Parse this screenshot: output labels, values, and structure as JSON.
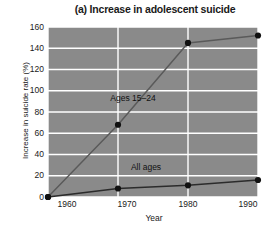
{
  "chart_data": {
    "type": "line",
    "title": "(a) Increase in adolescent suicide",
    "xlabel": "Year",
    "ylabel": "Increase in suicide rate (%)",
    "x": [
      1960,
      1970,
      1980,
      1990
    ],
    "xticklabels": [
      "1960",
      "1970",
      "1980",
      "1990"
    ],
    "yticklabels": [
      "0",
      "20",
      "40",
      "60",
      "80",
      "100",
      "120",
      "140",
      "160"
    ],
    "yticks": [
      0,
      20,
      40,
      60,
      80,
      100,
      120,
      140,
      160
    ],
    "xlim": [
      1960,
      1990
    ],
    "ylim": [
      0,
      160
    ],
    "grid": true,
    "legend": "inline-annotations",
    "plot_background": "#8a8a8a",
    "gridline_color": "#ffffff",
    "marker_color": "#111111",
    "series": [
      {
        "name": "Ages 15-24",
        "label": "Ages 15–24",
        "values": [
          0,
          68,
          145,
          152
        ],
        "line_color": "#5a5a5a"
      },
      {
        "name": "All ages",
        "label": "All ages",
        "values": [
          0,
          8,
          11,
          16
        ],
        "line_color": "#2b2b2b"
      }
    ]
  },
  "annotations": {
    "ages_15_24": "Ages 15–24",
    "all_ages": "All ages"
  }
}
